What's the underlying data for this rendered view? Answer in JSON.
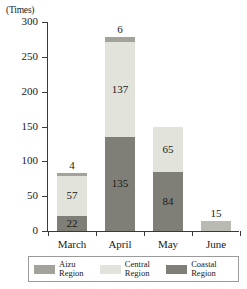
{
  "chart_data": {
    "type": "bar",
    "stacked": true,
    "title": "",
    "xlabel": "",
    "ylabel": "(Times)",
    "ylim": [
      0,
      300
    ],
    "yticks": [
      0,
      50,
      100,
      150,
      200,
      250,
      300
    ],
    "grid": false,
    "legend_position": "bottom",
    "categories": [
      "March",
      "April",
      "May",
      "June"
    ],
    "series": [
      {
        "name": "Coastal Region",
        "color": "#7f7f78",
        "values": [
          22,
          135,
          84,
          0
        ]
      },
      {
        "name": "Central Region",
        "color": "#e2e3da",
        "values": [
          57,
          137,
          65,
          15
        ]
      },
      {
        "name": "Aizu Region",
        "color": "#a3a39b",
        "values": [
          4,
          6,
          0,
          0
        ]
      }
    ],
    "stack_order_bottom_to_top": [
      "Coastal Region",
      "Central Region",
      "Aizu Region"
    ],
    "bar_totals": [
      4,
      6,
      15
    ],
    "bars": [
      {
        "category": "March",
        "total_label": "4",
        "total": 83,
        "segments": [
          {
            "series": "Aizu Region",
            "value": 4,
            "label": "",
            "color": "#a3a39b"
          },
          {
            "series": "Central Region",
            "value": 57,
            "label": "57",
            "color": "#e2e3da"
          },
          {
            "series": "Coastal Region",
            "value": 22,
            "label": "22",
            "color": "#7f7f78"
          }
        ]
      },
      {
        "category": "April",
        "total_label": "6",
        "total": 278,
        "segments": [
          {
            "series": "Aizu Region",
            "value": 6,
            "label": "",
            "color": "#a3a39b"
          },
          {
            "series": "Central Region",
            "value": 137,
            "label": "137",
            "color": "#e2e3da"
          },
          {
            "series": "Coastal Region",
            "value": 135,
            "label": "135",
            "color": "#7f7f78"
          }
        ]
      },
      {
        "category": "May",
        "total_label": "",
        "total": 149,
        "segments": [
          {
            "series": "Central Region",
            "value": 65,
            "label": "65",
            "color": "#e2e3da"
          },
          {
            "series": "Coastal Region",
            "value": 84,
            "label": "84",
            "color": "#7f7f78"
          }
        ]
      },
      {
        "category": "June",
        "total_label": "15",
        "total": 15,
        "segments": [
          {
            "series": "Central Region",
            "value": 15,
            "label": "",
            "color": "#b9bab1"
          }
        ]
      }
    ],
    "annotations": [
      {
        "text": "4",
        "near": "March top"
      },
      {
        "text": "6",
        "near": "April top"
      },
      {
        "text": "15",
        "near": "June top"
      }
    ]
  },
  "axis": {
    "y_unit": "(Times)",
    "y_tick_labels": [
      "300",
      "250",
      "200",
      "150",
      "100",
      "50",
      "0"
    ],
    "x_tick_labels": [
      "March",
      "April",
      "May",
      "June"
    ]
  },
  "legend": {
    "items": [
      {
        "label": "Aizu\nRegion",
        "color": "#a3a39b"
      },
      {
        "label": "Central\nRegion",
        "color": "#e2e3da"
      },
      {
        "label": "Coastal\nRegion",
        "color": "#7f7f78"
      }
    ]
  }
}
